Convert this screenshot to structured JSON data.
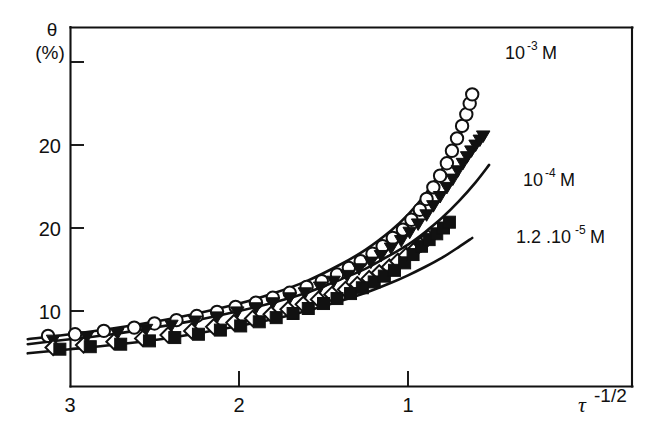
{
  "chart_data": {
    "type": "scatter",
    "title": "",
    "subtitle": "",
    "xlabel": "τ",
    "xlabel_sup": "-1/2",
    "ylabel": "θ",
    "ylabel_units": "(%)",
    "grid": false,
    "legend_position": "inline-right",
    "xlim": [
      3.35,
      0.35
    ],
    "ylim": [
      3.0,
      41.0
    ],
    "x_reversed": true,
    "xticks": [
      3,
      2,
      1
    ],
    "xticklabels": [
      "3",
      "2",
      "1"
    ],
    "yticks": [
      10,
      20,
      30,
      40
    ],
    "yticklabels": [
      "10",
      "20",
      "30",
      ""
    ],
    "annotations": [
      {
        "text": "10",
        "sup": "-3",
        "unit": "M",
        "label": "10⁻³ M",
        "x": 0.93,
        "y": 39.0
      },
      {
        "text": "10",
        "sup": "-4",
        "unit": "M",
        "label": "10⁻⁴ M",
        "x": 0.8,
        "y": 27.0
      },
      {
        "text": "1.2 .10",
        "sup": "-5",
        "unit": "M",
        "label": "1.2 .10⁻⁵ M",
        "x": 0.82,
        "y": 20.0
      }
    ],
    "curves": [
      {
        "name": "fit-10-3-M",
        "label": "10⁻³ M",
        "x": [
          3.25,
          3.0,
          2.75,
          2.5,
          2.25,
          2.0,
          1.8,
          1.6,
          1.4,
          1.25,
          1.1,
          1.0,
          0.9,
          0.8,
          0.72,
          0.66
        ],
        "y": [
          6.6,
          7.2,
          7.9,
          8.7,
          9.7,
          10.9,
          12.1,
          13.6,
          15.6,
          17.4,
          19.7,
          21.6,
          24.0,
          27.0,
          30.0,
          32.6
        ]
      },
      {
        "name": "fit-10-4-M",
        "label": "10⁻⁴ M",
        "x": [
          3.25,
          3.0,
          2.75,
          2.5,
          2.25,
          2.0,
          1.8,
          1.6,
          1.4,
          1.25,
          1.1,
          1.0,
          0.9,
          0.8,
          0.7,
          0.6,
          0.52
        ],
        "y": [
          6.0,
          6.6,
          7.2,
          8.0,
          8.9,
          10.0,
          11.0,
          12.2,
          13.8,
          15.1,
          16.8,
          18.0,
          19.5,
          21.2,
          23.2,
          25.5,
          27.6
        ]
      },
      {
        "name": "fit-1.2-10-5-M",
        "label": "1.2 .10⁻⁵ M",
        "x": [
          3.25,
          3.0,
          2.75,
          2.5,
          2.25,
          2.0,
          1.8,
          1.6,
          1.4,
          1.25,
          1.1,
          1.0,
          0.9,
          0.8,
          0.7,
          0.62
        ],
        "y": [
          4.9,
          5.4,
          5.9,
          6.5,
          7.3,
          8.2,
          9.0,
          10.0,
          11.2,
          12.2,
          13.4,
          14.3,
          15.3,
          16.4,
          17.7,
          18.8
        ]
      }
    ],
    "series": [
      {
        "name": "open-circle-series",
        "marker": "open-circle",
        "points": [
          [
            3.13,
            7.0
          ],
          [
            2.97,
            7.2
          ],
          [
            2.8,
            7.6
          ],
          [
            2.62,
            8.0
          ],
          [
            2.5,
            8.5
          ],
          [
            2.37,
            8.9
          ],
          [
            2.25,
            9.4
          ],
          [
            2.13,
            9.9
          ],
          [
            2.02,
            10.5
          ],
          [
            1.9,
            11.0
          ],
          [
            1.8,
            11.6
          ],
          [
            1.7,
            12.2
          ],
          [
            1.6,
            12.9
          ],
          [
            1.51,
            13.6
          ],
          [
            1.42,
            14.4
          ],
          [
            1.35,
            15.2
          ],
          [
            1.28,
            16.0
          ],
          [
            1.21,
            16.9
          ],
          [
            1.15,
            17.8
          ],
          [
            1.09,
            18.8
          ],
          [
            1.03,
            19.8
          ],
          [
            0.98,
            21.0
          ],
          [
            0.93,
            22.2
          ],
          [
            0.89,
            23.5
          ],
          [
            0.85,
            24.9
          ],
          [
            0.81,
            26.3
          ],
          [
            0.77,
            27.8
          ],
          [
            0.74,
            29.3
          ],
          [
            0.71,
            30.8
          ],
          [
            0.68,
            32.3
          ],
          [
            0.655,
            33.7
          ],
          [
            0.635,
            35.0
          ],
          [
            0.62,
            36.1
          ]
        ]
      },
      {
        "name": "filled-triangle-series",
        "marker": "filled-triangle-down",
        "points": [
          [
            3.1,
            6.4
          ],
          [
            2.9,
            6.8
          ],
          [
            2.72,
            7.2
          ],
          [
            2.55,
            7.7
          ],
          [
            2.4,
            8.2
          ],
          [
            2.26,
            8.7
          ],
          [
            2.13,
            9.2
          ],
          [
            2.01,
            9.8
          ],
          [
            1.9,
            10.3
          ],
          [
            1.8,
            10.9
          ],
          [
            1.7,
            11.5
          ],
          [
            1.61,
            12.1
          ],
          [
            1.52,
            12.8
          ],
          [
            1.44,
            13.5
          ],
          [
            1.36,
            14.2
          ],
          [
            1.29,
            15.0
          ],
          [
            1.22,
            15.8
          ],
          [
            1.16,
            16.6
          ],
          [
            1.1,
            17.5
          ],
          [
            1.04,
            18.4
          ],
          [
            0.99,
            19.4
          ],
          [
            0.94,
            20.4
          ],
          [
            0.89,
            21.5
          ],
          [
            0.85,
            22.6
          ],
          [
            0.81,
            23.7
          ],
          [
            0.77,
            24.8
          ],
          [
            0.735,
            25.8
          ],
          [
            0.705,
            26.8
          ],
          [
            0.675,
            27.7
          ],
          [
            0.65,
            28.5
          ],
          [
            0.625,
            29.2
          ],
          [
            0.6,
            29.9
          ],
          [
            0.575,
            30.5
          ],
          [
            0.555,
            31.0
          ]
        ]
      },
      {
        "name": "open-diamond-series",
        "marker": "open-diamond",
        "points": [
          [
            3.1,
            5.6
          ],
          [
            2.92,
            5.9
          ],
          [
            2.74,
            6.3
          ],
          [
            2.57,
            6.7
          ],
          [
            2.42,
            7.1
          ],
          [
            2.28,
            7.6
          ],
          [
            2.15,
            8.1
          ],
          [
            2.03,
            8.6
          ],
          [
            1.92,
            9.1
          ],
          [
            1.81,
            9.6
          ],
          [
            1.71,
            10.2
          ],
          [
            1.62,
            10.8
          ],
          [
            1.53,
            11.4
          ],
          [
            1.45,
            12.0
          ],
          [
            1.37,
            12.6
          ],
          [
            1.3,
            13.2
          ],
          [
            1.23,
            13.9
          ],
          [
            1.17,
            14.6
          ],
          [
            1.11,
            15.3
          ],
          [
            1.06,
            16.0
          ],
          [
            1.01,
            16.7
          ],
          [
            0.96,
            17.4
          ],
          [
            0.92,
            18.1
          ],
          [
            0.88,
            18.8
          ]
        ]
      },
      {
        "name": "filled-square-series",
        "marker": "filled-square",
        "points": [
          [
            3.06,
            5.4
          ],
          [
            2.88,
            5.7
          ],
          [
            2.7,
            6.0
          ],
          [
            2.53,
            6.4
          ],
          [
            2.38,
            6.8
          ],
          [
            2.24,
            7.2
          ],
          [
            2.11,
            7.7
          ],
          [
            1.99,
            8.2
          ],
          [
            1.88,
            8.7
          ],
          [
            1.78,
            9.2
          ],
          [
            1.68,
            9.7
          ],
          [
            1.59,
            10.3
          ],
          [
            1.5,
            10.9
          ],
          [
            1.42,
            11.5
          ],
          [
            1.34,
            12.1
          ],
          [
            1.27,
            12.8
          ],
          [
            1.2,
            13.5
          ],
          [
            1.14,
            14.2
          ],
          [
            1.08,
            14.9
          ],
          [
            1.02,
            15.8
          ],
          [
            0.97,
            16.8
          ],
          [
            0.92,
            17.8
          ],
          [
            0.875,
            18.6
          ],
          [
            0.83,
            19.3
          ],
          [
            0.79,
            20.0
          ],
          [
            0.755,
            20.7
          ]
        ]
      }
    ]
  },
  "axes": {
    "y_title": "θ",
    "y_units": "(%)",
    "x_title": "τ",
    "x_title_sup": "-1/2"
  }
}
